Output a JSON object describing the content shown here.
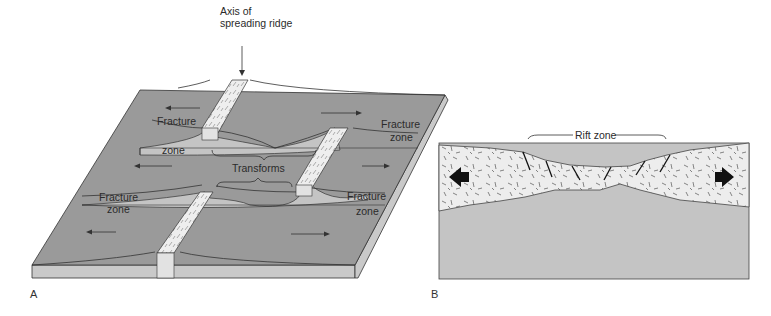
{
  "figure": {
    "panel_a": {
      "letter": "A",
      "labels": {
        "axis_line1": "Axis of",
        "axis_line2": "spreading ridge",
        "fz1_top": "Fracture",
        "fz1_bottom": "zone",
        "fz2_top": "Fracture",
        "fz2_bottom": "zone",
        "fz3_top": "Fracture",
        "fz3_bottom": "zone",
        "fz4_top": "Fracture",
        "fz4_bottom": "zone",
        "transforms": "Transforms"
      },
      "colors": {
        "plate_top": "#9a9a9a",
        "plate_side": "#c9c9c9",
        "ridge": "#e6e6e6",
        "line": "#333333"
      }
    },
    "panel_b": {
      "letter": "B",
      "labels": {
        "rift_zone": "Rift zone"
      },
      "colors": {
        "crust": "#ededed",
        "mantle": "#c4c4c4",
        "arrow": "#111111"
      }
    }
  }
}
